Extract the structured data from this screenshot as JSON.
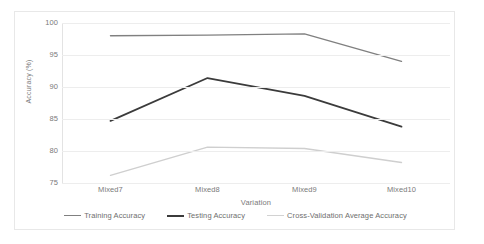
{
  "chart_data": {
    "type": "line",
    "title": "",
    "xlabel": "Variation",
    "ylabel": "Accuracy (%)",
    "categories": [
      "Mixed7",
      "Mixed8",
      "Mixed9",
      "Mixed10"
    ],
    "ylim": [
      75,
      100
    ],
    "yticks": [
      75,
      80,
      85,
      90,
      95,
      100
    ],
    "ytick_labels": [
      "75",
      "80",
      "85",
      "90",
      "95",
      "100"
    ],
    "grid": true,
    "legend_position": "bottom",
    "series": [
      {
        "name": "Training Accuracy",
        "color": "#808080",
        "width": 1.4,
        "values": [
          98.0,
          98.1,
          98.3,
          94.0
        ]
      },
      {
        "name": "Testing Accuracy",
        "color": "#3b3b3b",
        "width": 1.8,
        "values": [
          84.7,
          91.4,
          88.6,
          83.8
        ]
      },
      {
        "name": "Cross-Validation Average Accuracy",
        "color": "#cfcfcf",
        "width": 1.4,
        "values": [
          76.2,
          80.6,
          80.4,
          78.2
        ]
      }
    ]
  },
  "axes": {
    "y_title": "Accuracy (%)",
    "x_title": "Variation",
    "y_ticks": [
      "100",
      "95",
      "90",
      "85",
      "80",
      "75"
    ],
    "x_ticks": [
      "Mixed7",
      "Mixed8",
      "Mixed9",
      "Mixed10"
    ]
  },
  "legend": {
    "items": [
      {
        "label": "Training Accuracy",
        "color": "#808080",
        "thickness": "1.4px"
      },
      {
        "label": "Testing Accuracy",
        "color": "#3b3b3b",
        "thickness": "2px"
      },
      {
        "label": "Cross-Validation Average Accuracy",
        "color": "#d2d2d2",
        "thickness": "1.4px"
      }
    ]
  },
  "colors": {
    "grid": "#ededed",
    "text": "#7a7a7a",
    "border": "#e8e8e8",
    "background": "#ffffff"
  }
}
